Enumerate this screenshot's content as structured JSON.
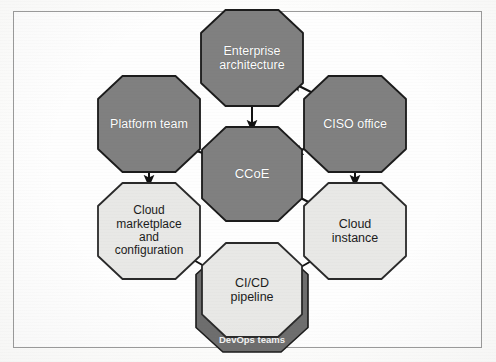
{
  "diagram": {
    "frame": {
      "border_color": "#9a9a9a",
      "background": "#fefefe"
    },
    "palette": {
      "dark_fill": "#808080",
      "dark_stroke": "#1a1a1a",
      "light_fill": "#e8e8e6",
      "light_stroke": "#2a2a2a",
      "band_fill": "#6e6e6e",
      "band_stroke": "#1a1a1a",
      "arrow_color": "#111111",
      "dark_text": "#ffffff",
      "light_text": "#1c1c1c"
    },
    "nodes": [
      {
        "id": "enterprise-architecture",
        "label": "Enterprise\narchitecture",
        "style": "dark",
        "cx": 252,
        "cy": 58,
        "rx": 51,
        "ry": 48,
        "font_size": 12.5
      },
      {
        "id": "platform-team",
        "label": "Platform team",
        "style": "dark",
        "cx": 149,
        "cy": 124,
        "rx": 51,
        "ry": 48,
        "font_size": 12.5
      },
      {
        "id": "ciso-office",
        "label": "CISO office",
        "style": "dark",
        "cx": 355,
        "cy": 124,
        "rx": 51,
        "ry": 48,
        "font_size": 12.5
      },
      {
        "id": "ccoe",
        "label": "CCoE",
        "style": "dark",
        "cx": 252,
        "cy": 174,
        "rx": 50,
        "ry": 47,
        "font_size": 13
      },
      {
        "id": "cloud-marketplace-and-configuration",
        "label": "Cloud\nmarketplace\nand\nconfiguration",
        "style": "light",
        "cx": 149,
        "cy": 231,
        "rx": 51,
        "ry": 48,
        "font_size": 12
      },
      {
        "id": "cloud-instance",
        "label": "Cloud\ninstance",
        "style": "light",
        "cx": 355,
        "cy": 231,
        "rx": 51,
        "ry": 48,
        "font_size": 12.5
      },
      {
        "id": "cicd-pipeline",
        "label": "CI/CD\npipeline",
        "style": "light",
        "cx": 252,
        "cy": 290,
        "rx": 50,
        "ry": 47,
        "font_size": 12.5
      }
    ],
    "band": {
      "id": "devops-teams-band",
      "label": "DevOps teams",
      "cx": 252,
      "cy": 301,
      "rx": 56,
      "ry": 51,
      "font_size": 9.5,
      "text_x": 252,
      "text_y": 343
    },
    "edges": [
      {
        "id": "ciso-to-enterprise-architecture",
        "from": "ciso-office",
        "to": "enterprise-architecture",
        "x1": 323,
        "y1": 98,
        "x2": 291,
        "y2": 82
      },
      {
        "id": "enterprise-architecture-to-ccoe",
        "from": "enterprise-architecture",
        "to": "ccoe",
        "x1": 252,
        "y1": 103,
        "x2": 252,
        "y2": 131
      },
      {
        "id": "ccoe-to-platform-team",
        "from": "ccoe",
        "to": "platform-team",
        "x1": 212,
        "y1": 156,
        "x2": 184,
        "y2": 147
      },
      {
        "id": "ciso-to-ccoe",
        "from": "ciso-office",
        "to": "ccoe",
        "x1": 321,
        "y1": 140,
        "x2": 292,
        "y2": 155
      },
      {
        "id": "platform-team-to-cloud-marketplace",
        "from": "platform-team",
        "to": "cloud-marketplace-and-configuration",
        "x1": 149,
        "y1": 170,
        "x2": 149,
        "y2": 186
      },
      {
        "id": "ciso-to-cloud-instance",
        "from": "ciso-office",
        "to": "cloud-instance",
        "x1": 355,
        "y1": 170,
        "x2": 355,
        "y2": 186
      },
      {
        "id": "ccoe-to-cloud-instance",
        "from": "ccoe",
        "to": "cloud-instance",
        "x1": 293,
        "y1": 194,
        "x2": 322,
        "y2": 209
      },
      {
        "id": "cloud-marketplace-to-cicd",
        "from": "cloud-marketplace-and-configuration",
        "to": "cicd-pipeline",
        "x1": 183,
        "y1": 254,
        "x2": 213,
        "y2": 271
      },
      {
        "id": "cicd-to-cloud-instance",
        "from": "cicd-pipeline",
        "to": "cloud-instance",
        "x1": 292,
        "y1": 272,
        "x2": 322,
        "y2": 255
      }
    ]
  }
}
